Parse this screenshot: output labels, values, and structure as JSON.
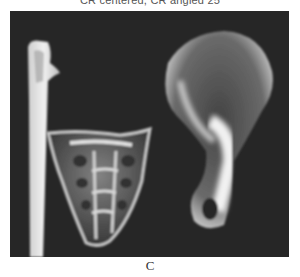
{
  "figure": {
    "top_caption": "CR centered, CR angled 25",
    "panel_label": "C",
    "image_description": "Radiograph of bones: long bone shaft (left), sacrum (center-left), ilium / hip bone (right)",
    "colors": {
      "background": "#262626",
      "bone": "#e8e8e8"
    }
  }
}
